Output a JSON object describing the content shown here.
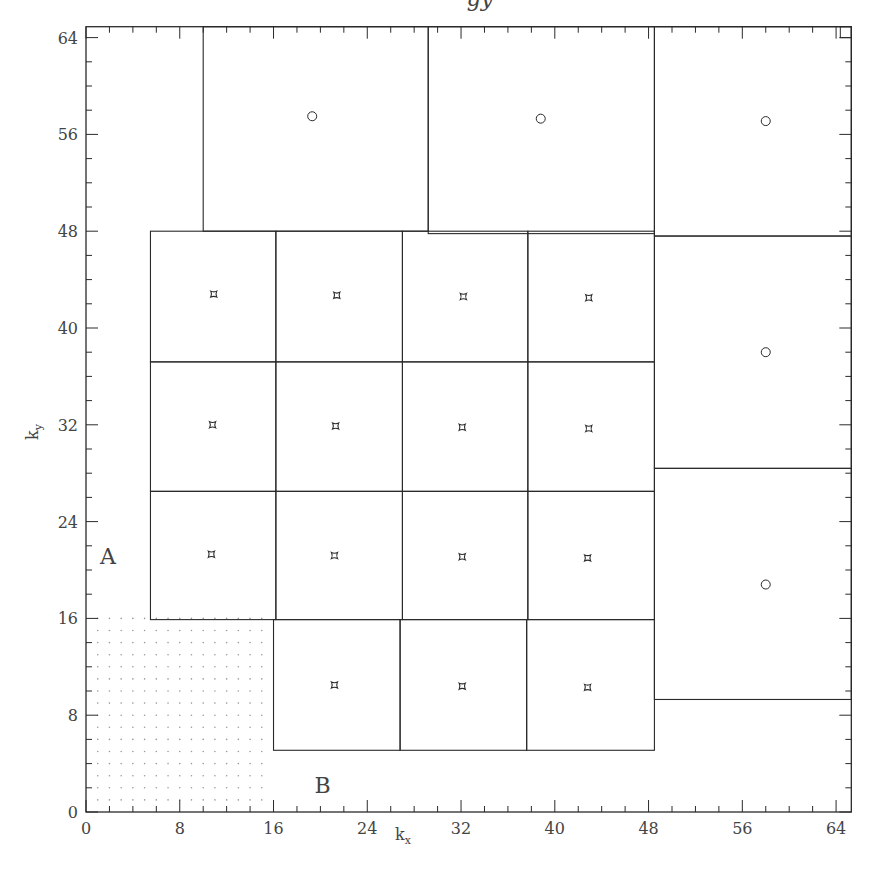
{
  "title_fragment": "gy",
  "axes": {
    "xlabel": "k",
    "xlabel_sub": "x",
    "ylabel": "k",
    "ylabel_sub": "y",
    "xlim": [
      0,
      65.3
    ],
    "ylim": [
      0,
      64.9
    ],
    "x_major_ticks": [
      0,
      8,
      16,
      24,
      32,
      40,
      48,
      56,
      64
    ],
    "y_major_ticks": [
      0,
      8,
      16,
      24,
      32,
      40,
      48,
      56,
      64
    ],
    "minor_step": 2
  },
  "labels": [
    {
      "text": "A",
      "x": 1.2,
      "y": 20.5
    },
    {
      "text": "B",
      "x": 19.5,
      "y": 1.6
    }
  ],
  "dotted_region": {
    "x0": 0,
    "x1": 16,
    "y0": 0,
    "y1": 16,
    "step": 1
  },
  "boxes": {
    "top_row": [
      {
        "x0": 10.0,
        "x1": 29.2,
        "y0": 48.0,
        "y1": 64.9,
        "marker": "circle",
        "mx": 19.3,
        "my": 57.5
      },
      {
        "x0": 29.2,
        "x1": 48.5,
        "y0": 47.8,
        "y1": 64.9,
        "marker": "circle",
        "mx": 38.8,
        "my": 57.3
      },
      {
        "x0": 48.5,
        "x1": 65.3,
        "y0": 47.6,
        "y1": 64.9,
        "marker": "circle",
        "mx": 58.0,
        "my": 57.1
      }
    ],
    "grid": {
      "x_edges": [
        5.5,
        16.2,
        27.0,
        37.7,
        48.5
      ],
      "y_edges": [
        48.0,
        37.2,
        26.5,
        15.9
      ],
      "markers": [
        {
          "mx": 10.9,
          "my": 42.8
        },
        {
          "mx": 21.4,
          "my": 42.7
        },
        {
          "mx": 32.2,
          "my": 42.6
        },
        {
          "mx": 42.9,
          "my": 42.5
        },
        {
          "mx": 10.8,
          "my": 32.0
        },
        {
          "mx": 21.3,
          "my": 31.9
        },
        {
          "mx": 32.1,
          "my": 31.8
        },
        {
          "mx": 42.9,
          "my": 31.7
        },
        {
          "mx": 10.7,
          "my": 21.3
        },
        {
          "mx": 21.2,
          "my": 21.2
        },
        {
          "mx": 32.1,
          "my": 21.1
        },
        {
          "mx": 42.8,
          "my": 21.0
        }
      ]
    },
    "bottom_row": {
      "x_edges": [
        16.0,
        26.8,
        37.6,
        48.5
      ],
      "y0": 5.1,
      "y1": 15.9,
      "markers": [
        {
          "mx": 21.2,
          "my": 10.5
        },
        {
          "mx": 32.1,
          "my": 10.4
        },
        {
          "mx": 42.8,
          "my": 10.3
        }
      ]
    },
    "right_column": [
      {
        "x0": 48.5,
        "x1": 65.3,
        "y0": 28.4,
        "y1": 47.6,
        "marker": "circle",
        "mx": 58.0,
        "my": 38.0
      },
      {
        "x0": 48.5,
        "x1": 65.3,
        "y0": 9.3,
        "y1": 28.4,
        "marker": "circle",
        "mx": 58.0,
        "my": 18.8
      }
    ]
  },
  "colors": {
    "line": "#2a2a2a",
    "dot": "#9a9a9a",
    "text": "#444444"
  }
}
